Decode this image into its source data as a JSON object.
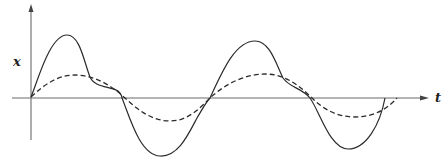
{
  "diagram": {
    "y_axis_label": "x",
    "x_axis_label": "t",
    "colors": {
      "line": "#2a2a2a",
      "axis": "#6a6a6a",
      "background": "#ffffff"
    },
    "curves": [
      {
        "name": "resultant",
        "style": "solid",
        "description": "Distorted periodic waveform (fundamental plus harmonic)",
        "key_points": [
          [
            31,
            97
          ],
          [
            67,
            35
          ],
          [
            90,
            77
          ],
          [
            118,
            91
          ],
          [
            122,
            98
          ],
          [
            172,
            155
          ],
          [
            210,
            98
          ],
          [
            255,
            41
          ],
          [
            283,
            78
          ],
          [
            310,
            98
          ],
          [
            348,
            149
          ],
          [
            385,
            98
          ]
        ]
      },
      {
        "name": "fundamental",
        "style": "dashed",
        "description": "Sinusoidal fundamental component",
        "key_points": [
          [
            31,
            97
          ],
          [
            75,
            75
          ],
          [
            125,
            98
          ],
          [
            170,
            121
          ],
          [
            210,
            98
          ],
          [
            265,
            74
          ],
          [
            312,
            98
          ],
          [
            355,
            117
          ],
          [
            397,
            98
          ]
        ]
      }
    ]
  }
}
